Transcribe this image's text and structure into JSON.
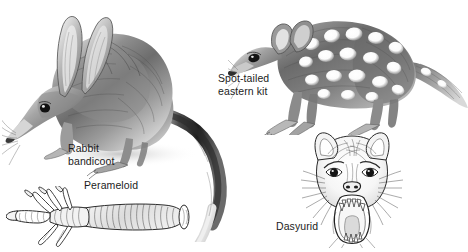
{
  "plate": {
    "title": "Marsupial anatomy comparison plate",
    "background_color": "#ffffff",
    "ink_color": "#1c1c1c",
    "width": 468,
    "height": 252
  },
  "captions": {
    "rabbit_bandicoot": "Rabbit\nbandicoot",
    "spot_tailed": "Spot-tailed\neastern kit",
    "perameloid": "Perameloid",
    "dasyurid": "Dasyurid"
  },
  "figures": {
    "bandicoot": {
      "name": "rabbit-bandicoot-illustration",
      "description": "Pencil drawing of a bilby-like rabbit bandicoot in profile facing left, long pointed snout, very large upright ears, arched grizzled back and a long tapering black-and-white tail curving down to the lower right."
    },
    "quoll": {
      "name": "spot-tailed-quoll-illustration",
      "description": "Pencil drawing of a spotted quoll in profile facing left, white spots over dark brown fur, rounded ears, long tail sweeping off to the right edge."
    },
    "foot": {
      "name": "perameloid-foot-illustration",
      "description": "Pen drawing of a syndactylous perameloid hind foot shown horizontally, fused second and third toes on the left, elongated fourth toe with heavy claw, furred metatarsus to the right."
    },
    "dasyurid": {
      "name": "dasyurid-head-illustration",
      "description": "Pen drawing of a snarling dasyurid head seen face-on, bristling whiskers, rounded ears, mouth gaping wide to show upper and lower rows of teeth."
    }
  }
}
